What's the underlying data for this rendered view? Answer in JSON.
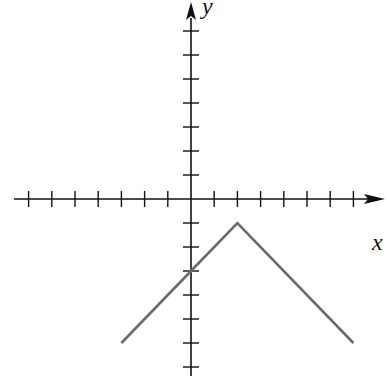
{
  "chart_data": {
    "type": "line",
    "title": "",
    "xlabel": "x",
    "ylabel": "y",
    "xlim": [
      -7,
      7
    ],
    "ylim": [
      -7,
      7
    ],
    "x_ticks": [
      -7,
      -6,
      -5,
      -4,
      -3,
      -2,
      -1,
      1,
      2,
      3,
      4,
      5,
      6,
      7
    ],
    "y_ticks": [
      -7,
      -6,
      -5,
      -4,
      -3,
      -2,
      -1,
      1,
      2,
      3,
      4,
      5,
      6,
      7
    ],
    "tick_labels_shown": false,
    "grid": false,
    "series": [
      {
        "name": "f(x) = -|x - 2| - 1",
        "points": [
          [
            -3,
            -6
          ],
          [
            0,
            -3
          ],
          [
            2,
            -1
          ],
          [
            7,
            -6
          ]
        ],
        "color": "#6b6b6b"
      }
    ]
  },
  "axes": {
    "x_label": "x",
    "y_label": "y",
    "axis_color": "#111111"
  }
}
